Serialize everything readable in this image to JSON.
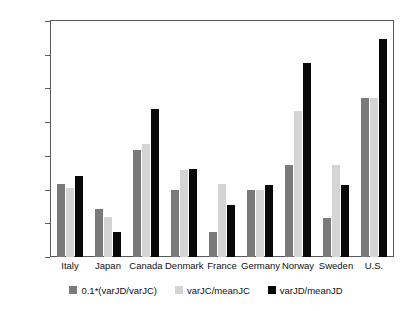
{
  "chart_data": {
    "type": "bar",
    "title": "",
    "subtitle": "",
    "xlabel": "",
    "ylabel": "",
    "ylim": [
      0,
      0.35
    ],
    "yticks": [
      "0",
      "0.05",
      "0.1",
      "0.15",
      "0.2",
      "0.25",
      "0.3",
      "0.35"
    ],
    "ytick_values": [
      0,
      0.05,
      0.1,
      0.15,
      0.2,
      0.25,
      0.3,
      0.35
    ],
    "grid": false,
    "legend_position": "bottom-center",
    "categories": [
      "Italy",
      "Japan",
      "Canada",
      "Denmark",
      "France",
      "Germany",
      "Norway",
      "Sweden",
      "U.S."
    ],
    "series": [
      {
        "name": "0.1*(varJD/varJC)",
        "color": "#7a7a7a",
        "values": [
          0.109,
          0.071,
          0.158,
          0.099,
          0.037,
          0.099,
          0.137,
          0.058,
          0.236
        ]
      },
      {
        "name": "varJC/meanJC",
        "color": "#d4d4d4",
        "values": [
          0.102,
          0.059,
          0.168,
          0.129,
          0.109,
          0.099,
          0.217,
          0.137,
          0.236
        ]
      },
      {
        "name": "varJD/meanJD",
        "color": "#080808",
        "values": [
          0.12,
          0.037,
          0.219,
          0.13,
          0.077,
          0.107,
          0.288,
          0.107,
          0.324
        ]
      }
    ]
  },
  "legend": {
    "items": [
      {
        "label": "0.1*(varJD/varJC)",
        "swatch": "dark-gray"
      },
      {
        "label": "varJC/meanJC",
        "swatch": "light-gray"
      },
      {
        "label": "varJD/meanJD",
        "swatch": "black"
      }
    ]
  }
}
